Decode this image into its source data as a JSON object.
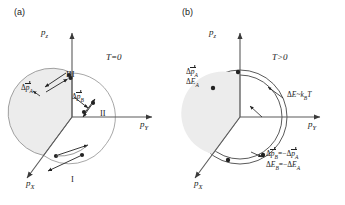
{
  "figure": {
    "type": "physics-diagram",
    "background": "#ffffff",
    "line_color": "#3a3a3a",
    "sphere_fill": "#ececec",
    "sphere_edge": "#6b6b6b"
  },
  "panels": [
    {
      "id": "a",
      "tag": "(a)",
      "temperature": "T=0",
      "axes": [
        {
          "name": "pz-axis",
          "label_html": "p<sub>z</sub>",
          "direction": "up"
        },
        {
          "name": "py-axis",
          "label_html": "p<sub>Y</sub>",
          "direction": "right"
        },
        {
          "name": "px-axis",
          "label_html": "p<sub>X</sub>",
          "direction": "lower-left"
        }
      ],
      "vectors": [
        {
          "name": "delta-p-A",
          "symbol": "Δp",
          "sub": "A",
          "arrow": true
        },
        {
          "name": "delta-p-B",
          "symbol": "Δp",
          "sub": "B",
          "arrow": true
        }
      ],
      "regions": [
        {
          "name": "region-I",
          "label": "I"
        },
        {
          "name": "region-II",
          "label": "II"
        },
        {
          "name": "region-III",
          "label": "III"
        }
      ]
    },
    {
      "id": "b",
      "tag": "(b)",
      "temperature": "T>0",
      "axes": [
        {
          "name": "pz-axis",
          "label_html": "p<sub>z</sub>",
          "direction": "up"
        },
        {
          "name": "py-axis",
          "label_html": "p<sub>Y</sub>",
          "direction": "right"
        },
        {
          "name": "px-axis",
          "label_html": "p<sub>X</sub>",
          "direction": "lower-left"
        }
      ],
      "labels": {
        "upper_left_line1": {
          "symbol": "Δp",
          "sub": "A"
        },
        "upper_left_line2": {
          "symbol": "ΔE",
          "sub": "A"
        },
        "shell_annotation": {
          "text": "ΔE~k",
          "sub": "B",
          "tail": "T"
        },
        "lower_right_line1": {
          "lhs_symbol": "Δp",
          "lhs_sub": "B",
          "eq": "=−",
          "rhs_symbol": "Δp",
          "rhs_sub": "A"
        },
        "lower_right_line2": {
          "text": "ΔE",
          "sub1": "B",
          "eq": "=−ΔE",
          "sub2": "A"
        }
      }
    }
  ]
}
